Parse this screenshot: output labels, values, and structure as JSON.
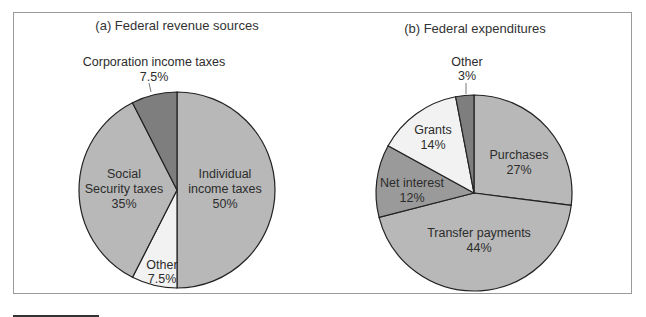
{
  "chart_data": [
    {
      "type": "pie",
      "title": "(a) Federal revenue sources",
      "categories": [
        "Individual income taxes",
        "Other",
        "Social Security taxes",
        "Corporation income taxes"
      ],
      "values": [
        50,
        7.5,
        35,
        7.5
      ],
      "value_labels": [
        "50%",
        "7.5%",
        "35%",
        "7.5%"
      ],
      "colors": [
        "#b8b8b8",
        "#f2f2f2",
        "#b8b8b8",
        "#7e7e7e"
      ],
      "start_angle_deg": 0,
      "direction": "clockwise",
      "legend": "none"
    },
    {
      "type": "pie",
      "title": "(b) Federal expenditures",
      "categories": [
        "Purchases",
        "Transfer payments",
        "Net interest",
        "Grants",
        "Other"
      ],
      "values": [
        27,
        44,
        12,
        14,
        3
      ],
      "value_labels": [
        "27%",
        "44%",
        "12%",
        "14%",
        "3%"
      ],
      "colors": [
        "#b8b8b8",
        "#b8b8b8",
        "#9a9a9a",
        "#f2f2f2",
        "#7e7e7e"
      ],
      "start_angle_deg": 0,
      "direction": "clockwise",
      "legend": "none"
    }
  ],
  "labels": {
    "a_title": "(a) Federal revenue sources",
    "a_individual_1": "Individual",
    "a_individual_2": "income taxes",
    "a_individual_pct": "50%",
    "a_other": "Other",
    "a_other_pct": "7.5%",
    "a_ss_1": "Social",
    "a_ss_2": "Security taxes",
    "a_ss_pct": "35%",
    "a_corp": "Corporation income taxes",
    "a_corp_pct": "7.5%",
    "b_title": "(b) Federal expenditures",
    "b_purchases": "Purchases",
    "b_purchases_pct": "27%",
    "b_transfer": "Transfer payments",
    "b_transfer_pct": "44%",
    "b_interest": "Net interest",
    "b_interest_pct": "12%",
    "b_grants": "Grants",
    "b_grants_pct": "14%",
    "b_other": "Other",
    "b_other_pct": "3%"
  }
}
